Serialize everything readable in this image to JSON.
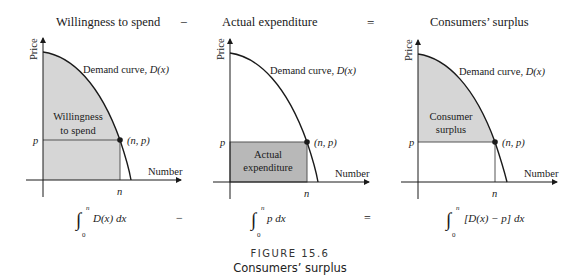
{
  "headers": {
    "panel1": "Willingness to spend",
    "op1": "−",
    "panel2": "Actual expenditure",
    "op2": "=",
    "panel3": "Consumers’ surplus"
  },
  "axes": {
    "y_label": "Price",
    "x_label": "Number",
    "p_label": "p",
    "n_label": "n",
    "point_label": "(n, p)",
    "curve_label_text": "Demand curve, ",
    "curve_label_fn": "D(x)"
  },
  "panels": [
    {
      "region_label_line1": "Willingness",
      "region_label_line2": "to spend",
      "shading": "area under D(x) from 0 to n"
    },
    {
      "region_label_line1": "Actual",
      "region_label_line2": "expenditure",
      "shading": "rectangle 0..n × 0..p"
    },
    {
      "region_label_line1": "Consumer",
      "region_label_line2": "surplus",
      "shading": "area between D(x) and p from 0 to n"
    }
  ],
  "formulas": {
    "f1_upper": "n",
    "f1_lower": "0",
    "f1_body": "D(x) dx",
    "op1": "−",
    "f2_upper": "n",
    "f2_lower": "0",
    "f2_body": "p dx",
    "op2": "=",
    "f3_upper": "n",
    "f3_lower": "0",
    "f3_body": "[D(x) − p] dx"
  },
  "caption": {
    "figure": "FIGURE 15.6",
    "title": "Consumers’ surplus"
  },
  "colors": {
    "shade_light": "#d6d6d6",
    "shade_dark": "#b8b8b8",
    "line": "#1a1a1a"
  }
}
